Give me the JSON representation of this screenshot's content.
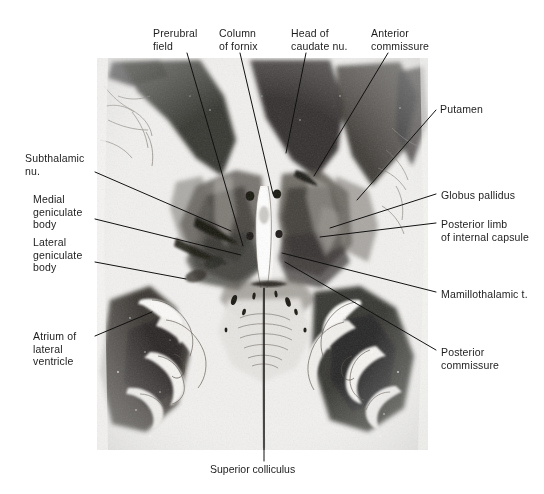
{
  "figure": {
    "type": "anatomical-section-figure",
    "background_color": "#ffffff",
    "text_color": "#1d1d1d",
    "leader_line_color": "#111111",
    "image_plate": {
      "x": 97,
      "y": 58,
      "width": 331,
      "height": 392
    }
  },
  "labels": [
    {
      "id": "prerubral-field",
      "text": "Prerubral\nfield",
      "text_x": 153,
      "text_y": 27,
      "leader": [
        [
          187,
          53
        ],
        [
          243,
          246
        ]
      ]
    },
    {
      "id": "column-of-fornix",
      "text": "Column\nof fornix",
      "text_x": 219,
      "text_y": 27,
      "leader": [
        [
          240,
          53
        ],
        [
          273,
          194
        ]
      ]
    },
    {
      "id": "head-of-caudate-nu",
      "text": "Head of\ncaudate nu.",
      "text_x": 291,
      "text_y": 27,
      "leader": [
        [
          306,
          53
        ],
        [
          286,
          153
        ]
      ]
    },
    {
      "id": "anterior-commissure",
      "text": "Anterior\ncommissure",
      "text_x": 371,
      "text_y": 27,
      "leader": [
        [
          388,
          53
        ],
        [
          314,
          176
        ]
      ]
    },
    {
      "id": "putamen",
      "text": "Putamen",
      "text_x": 440,
      "text_y": 103,
      "leader": [
        [
          436,
          110
        ],
        [
          357,
          200
        ]
      ]
    },
    {
      "id": "globus-pallidus",
      "text": "Globus pallidus",
      "text_x": 441,
      "text_y": 189,
      "leader": [
        [
          436,
          194
        ],
        [
          330,
          228
        ]
      ]
    },
    {
      "id": "posterior-limb-of-internal-capsule",
      "text": "Posterior limb\nof internal capsule",
      "text_x": 441,
      "text_y": 218,
      "leader": [
        [
          436,
          223
        ],
        [
          320,
          237
        ]
      ]
    },
    {
      "id": "mamillothalamic-t",
      "text": "Mamillothalamic t.",
      "text_x": 441,
      "text_y": 288,
      "leader": [
        [
          436,
          292
        ],
        [
          282,
          253
        ]
      ]
    },
    {
      "id": "posterior-commissure",
      "text": "Posterior\ncommissure",
      "text_x": 441,
      "text_y": 346,
      "leader": [
        [
          436,
          350
        ],
        [
          285,
          262
        ]
      ]
    },
    {
      "id": "subthalamic-nu",
      "text": "Subthalamic\nnu.",
      "text_x": 25,
      "text_y": 152,
      "leader": [
        [
          95,
          172
        ],
        [
          231,
          231
        ]
      ]
    },
    {
      "id": "medial-geniculate-body",
      "text": "Medial\ngeniculate\nbody",
      "text_x": 33,
      "text_y": 193,
      "leader": [
        [
          95,
          219
        ],
        [
          241,
          255
        ]
      ]
    },
    {
      "id": "lateral-geniculate-body",
      "text": "Lateral\ngeniculate\nbody",
      "text_x": 33,
      "text_y": 236,
      "leader": [
        [
          95,
          262
        ],
        [
          186,
          279
        ]
      ]
    },
    {
      "id": "atrium-of-lateral-ventricle",
      "text": "Atrium of\nlateral\nventricle",
      "text_x": 33,
      "text_y": 330,
      "leader": [
        [
          95,
          336
        ],
        [
          152,
          312
        ]
      ]
    },
    {
      "id": "superior-colliculus",
      "text": "Superior colliculus",
      "text_x": 210,
      "text_y": 463,
      "leader": [
        [
          264,
          461
        ],
        [
          264,
          288
        ]
      ]
    }
  ]
}
